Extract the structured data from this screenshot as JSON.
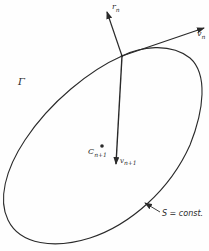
{
  "diagram": {
    "labels": {
      "gamma": "Γ",
      "r_n": "r",
      "r_n_sub": "n",
      "v_n": "v",
      "v_n_sub": "n",
      "c_next": "C",
      "c_next_sub": "n+1",
      "v_next": "v",
      "v_next_sub": "n+1",
      "surface": "S = const."
    },
    "colors": {
      "stroke": "#2a2a2a",
      "background": "#fefefe"
    }
  }
}
